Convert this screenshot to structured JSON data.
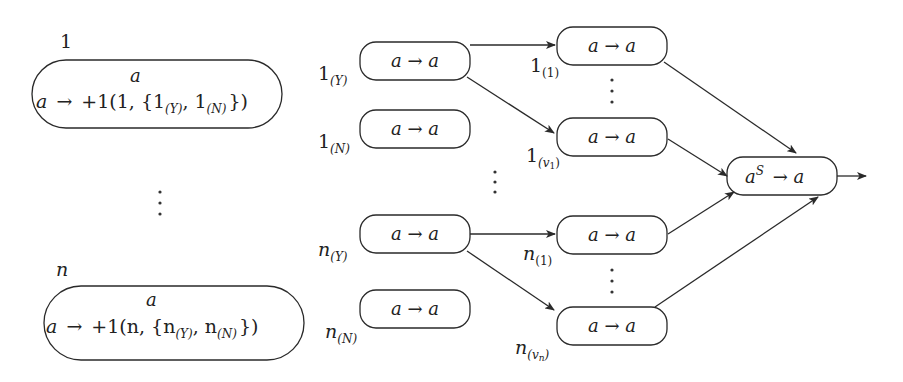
{
  "diagram": {
    "left_nodes": [
      {
        "label": "1",
        "top": "a",
        "rule_lhs": "a",
        "arrow": "→",
        "rule_rhs": "+1(1, {1",
        "sub_y": "(Y)",
        "sep": ", 1",
        "sub_n": "(N)",
        "close": "})"
      },
      {
        "label": "n",
        "top": "a",
        "rule_lhs": "a",
        "arrow": "→",
        "rule_rhs": "+1(n, {n",
        "sub_y": "(Y)",
        "sep": ", n",
        "sub_n": "(N)",
        "close": "})"
      }
    ],
    "middle_nodes": [
      {
        "base": "1",
        "sub": "(Y)",
        "rule": "a → a"
      },
      {
        "base": "1",
        "sub": "(N)",
        "rule": "a → a"
      },
      {
        "base": "n",
        "sub": "(Y)",
        "rule": "a → a"
      },
      {
        "base": "n",
        "sub": "(N)",
        "rule": "a → a"
      }
    ],
    "right_nodes": [
      {
        "base": "1",
        "sub": "(1)",
        "rule": "a → a"
      },
      {
        "base": "1",
        "sub": "(v",
        "subsub": "1",
        "subclose": ")",
        "rule": "a → a"
      },
      {
        "base": "n",
        "sub": "(1)",
        "rule": "a → a"
      },
      {
        "base": "n",
        "sub": "(v",
        "subsub": "n",
        "subclose": ")",
        "rule": "a → a"
      }
    ],
    "output_node": {
      "base": "a",
      "sup": "S",
      "rest": " → a"
    },
    "ellipsis": "⋮"
  }
}
